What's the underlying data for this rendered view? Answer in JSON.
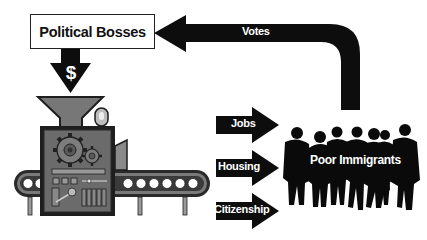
{
  "diagram": {
    "type": "flow",
    "nodes": {
      "political_bosses": {
        "label": "Political Bosses"
      },
      "machine": {
        "label": "",
        "icon": "political-machine-illustration"
      },
      "poor_immigrants": {
        "label": "Poor Immigrants",
        "icon": "crowd-silhouette"
      }
    },
    "edges": [
      {
        "from": "poor_immigrants",
        "to": "political_bosses",
        "label": "Votes"
      },
      {
        "from": "political_bosses",
        "to": "machine",
        "label": "$"
      },
      {
        "from": "machine",
        "to": "poor_immigrants",
        "label": "Jobs"
      },
      {
        "from": "machine",
        "to": "poor_immigrants",
        "label": "Housing"
      },
      {
        "from": "machine",
        "to": "poor_immigrants",
        "label": "Citizenship"
      }
    ]
  },
  "colors": {
    "arrow": "#0d0d0d",
    "machine_body": "#6b6b6b",
    "machine_dark": "#1e1e1e",
    "machine_light": "#9a9a9a",
    "background": "#ffffff"
  }
}
